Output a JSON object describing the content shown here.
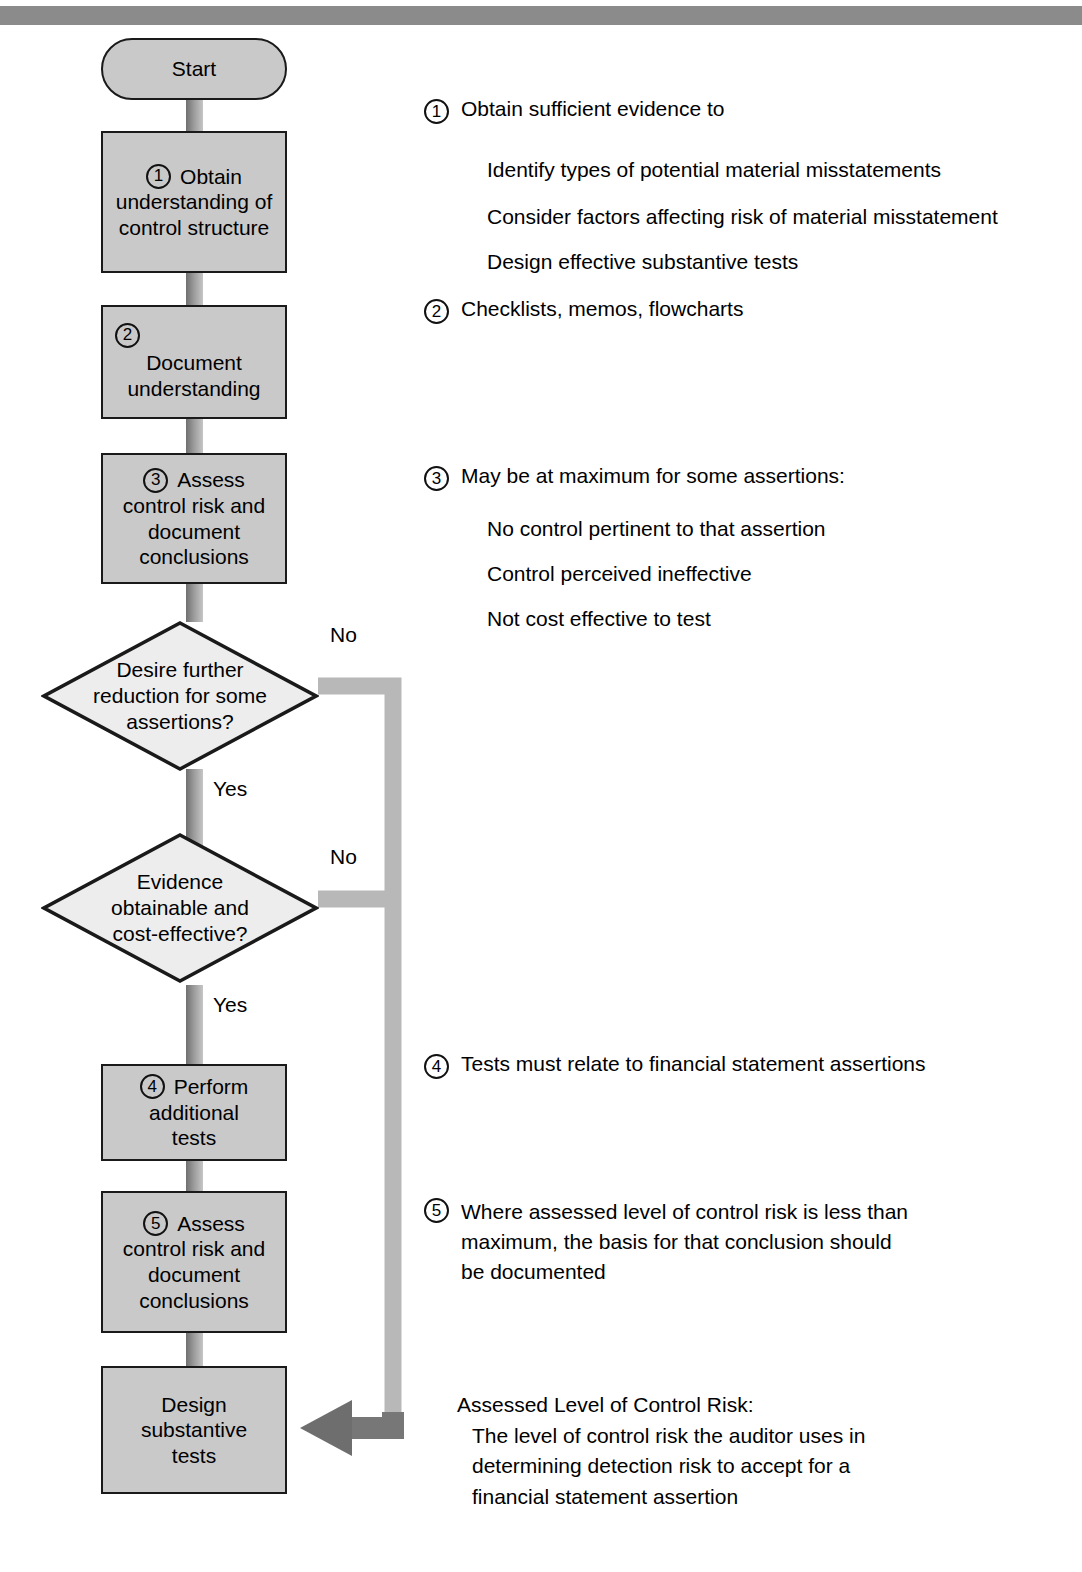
{
  "page": {
    "top_rule_color": "#8b8b8b",
    "node_fill": "#c9c9c9",
    "node_stroke": "#1a1a1a",
    "connector_color": "#8b8b8b"
  },
  "flow": {
    "start": {
      "label": "Start"
    },
    "step1": {
      "number": "1",
      "line1": "Obtain",
      "rest": "understanding of\ncontrol structure"
    },
    "step2": {
      "number": "2",
      "line1": "",
      "rest": "Document\nunderstanding"
    },
    "step3": {
      "number": "3",
      "line1": "Assess",
      "rest": "control risk and\ndocument\nconclusions"
    },
    "decision1": {
      "text": "Desire further\nreduction for some\nassertions?",
      "yes": "Yes",
      "no": "No"
    },
    "decision2": {
      "text": "Evidence\nobtainable and\ncost-effective?",
      "yes": "Yes",
      "no": "No"
    },
    "step4": {
      "number": "4",
      "line1": "Perform",
      "rest": "additional\ntests"
    },
    "step5": {
      "number": "5",
      "line1": "Assess",
      "rest": "control risk and\ndocument\nconclusions"
    },
    "final": {
      "label": "Design\nsubstantive\ntests"
    }
  },
  "annotations": [
    {
      "number": "1",
      "head": "Obtain sufficient evidence to",
      "subs": [
        "Identify types of potential material misstatements",
        "Consider factors affecting risk of material misstatement",
        "Design effective substantive tests"
      ]
    },
    {
      "number": "2",
      "head": "Checklists, memos, flowcharts",
      "subs": []
    },
    {
      "number": "3",
      "head": "May be at maximum for some assertions:",
      "subs": [
        "No control pertinent to that assertion",
        "Control perceived ineffective",
        "Not cost effective to test"
      ]
    },
    {
      "number": "4",
      "head": "Tests must relate to financial statement assertions",
      "subs": []
    },
    {
      "number": "5",
      "head": "Where assessed level of control risk is less than\nmaximum, the basis for that conclusion should\nbe documented",
      "subs": []
    }
  ],
  "definition": {
    "term": "Assessed Level of Control Risk:",
    "body": "The level of control risk the auditor uses in\ndetermining detection risk to accept for a\nfinancial statement assertion"
  }
}
